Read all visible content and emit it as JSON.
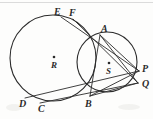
{
  "figure": {
    "type": "geometry-diagram",
    "canvas": {
      "width": 153,
      "height": 119
    },
    "ink_color": "#2b2b2b",
    "background_color": "#fdfdfc",
    "circles": [
      {
        "name": "circle-R",
        "center_label": "R",
        "cx": 53,
        "cy": 58,
        "r": 43
      },
      {
        "name": "circle-S",
        "center_label": "S",
        "cx": 107,
        "cy": 62,
        "r": 30
      }
    ],
    "points": [
      {
        "label": "E",
        "x": 57,
        "y": 13,
        "on": "circle-R"
      },
      {
        "label": "F",
        "x": 72,
        "y": 14,
        "on": "circle-R"
      },
      {
        "label": "A",
        "x": 104,
        "y": 32,
        "on": "both-circles"
      },
      {
        "label": "P",
        "x": 140,
        "y": 70,
        "on": "circle-S"
      },
      {
        "label": "Q",
        "x": 140,
        "y": 84,
        "on": "circle-S"
      },
      {
        "label": "B",
        "x": 89,
        "y": 98,
        "on": "both-circles"
      },
      {
        "label": "C",
        "x": 42,
        "y": 109,
        "on": "circle-R"
      },
      {
        "label": "D",
        "x": 23,
        "y": 105,
        "on": "circle-R"
      },
      {
        "label": "R",
        "x": 54,
        "y": 66,
        "on": "center-of-circle-R"
      },
      {
        "label": "S",
        "x": 108,
        "y": 72,
        "on": "center-of-circle-S"
      }
    ],
    "segments": [
      {
        "name": "segment-E-P",
        "from": "E",
        "to": "P"
      },
      {
        "name": "segment-F-Q",
        "from": "F",
        "to": "Q"
      },
      {
        "name": "segment-A-P",
        "from": "A",
        "to": "P"
      },
      {
        "name": "segment-A-Q",
        "from": "A",
        "to": "Q"
      },
      {
        "name": "segment-A-B",
        "from": "A",
        "to": "B"
      },
      {
        "name": "segment-D-P",
        "from": "D",
        "to": "P"
      },
      {
        "name": "segment-C-Q",
        "from": "C",
        "to": "Q"
      }
    ]
  }
}
